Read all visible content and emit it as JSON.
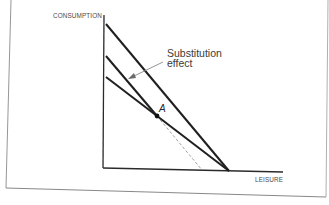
{
  "figure": {
    "y_axis_label": "CONSUMPTION",
    "x_axis_label": "LEISURE",
    "annotation": {
      "line1": "Substitution",
      "line2": "effect"
    },
    "point_label": "A",
    "colors": {
      "line": "#1f1f1f",
      "axis": "#2a2a2a",
      "dashed": "#8a8a8a",
      "frame": "#7a7a7a",
      "arrow": "#8a8a8a",
      "text": "#3a3a3a"
    }
  },
  "diagram_elements": {
    "lines": [
      {
        "name": "original-budget-line",
        "style": "solid",
        "from": [
          106,
          24
        ],
        "to": [
          229,
          171
        ]
      },
      {
        "name": "new-steep-budget-line",
        "style": "solid",
        "from": [
          106,
          56
        ],
        "to": [
          157,
          116
        ]
      },
      {
        "name": "new-steep-budget-line-extension",
        "style": "dashed",
        "from": [
          157,
          116
        ],
        "to": [
          202,
          170
        ]
      },
      {
        "name": "new-flat-budget-line",
        "style": "solid",
        "from": [
          106,
          77
        ],
        "to": [
          229,
          171
        ]
      }
    ],
    "point": {
      "name": "A",
      "at": [
        157,
        116
      ]
    },
    "arrow": {
      "from": [
        162,
        62
      ],
      "to": [
        129,
        78
      ]
    }
  }
}
